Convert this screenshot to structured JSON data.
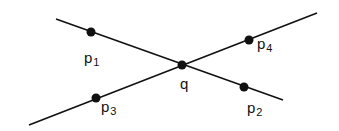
{
  "diagram": {
    "lines": [
      {
        "id": "line-p1-p2",
        "x1": 56,
        "y1": 19,
        "x2": 283,
        "y2": 100
      },
      {
        "id": "line-p3-p4",
        "x1": 29,
        "y1": 125,
        "x2": 317,
        "y2": 13
      }
    ],
    "points": [
      {
        "id": "p1",
        "base": "p",
        "sub": "1",
        "x": 91,
        "y": 32,
        "lx": 84,
        "ly": 63
      },
      {
        "id": "p2",
        "base": "p",
        "sub": "2",
        "x": 244,
        "y": 87,
        "lx": 247,
        "ly": 113
      },
      {
        "id": "p3",
        "base": "p",
        "sub": "3",
        "x": 96,
        "y": 98,
        "lx": 101,
        "ly": 112
      },
      {
        "id": "p4",
        "base": "p",
        "sub": "4",
        "x": 249,
        "y": 40,
        "lx": 257,
        "ly": 49
      },
      {
        "id": "q",
        "base": "q",
        "sub": "",
        "x": 182,
        "y": 65,
        "lx": 180,
        "ly": 89
      }
    ],
    "colors": {
      "stroke": "#111111",
      "point": "#111111"
    }
  }
}
